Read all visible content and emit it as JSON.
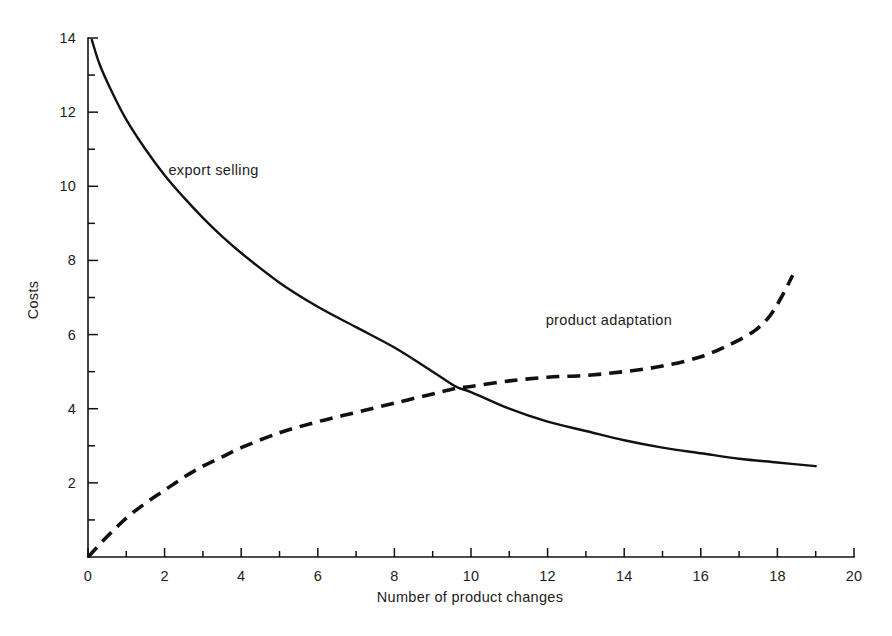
{
  "chart_data": {
    "type": "line",
    "title": "",
    "subtitle": "",
    "xlabel": "Number of product changes",
    "ylabel": "Costs",
    "xlim": [
      0,
      20
    ],
    "ylim": [
      0,
      14
    ],
    "grid": false,
    "legend_position": "inline-annotations",
    "x_ticks_major": [
      0,
      2,
      4,
      6,
      8,
      10,
      12,
      14,
      16,
      18,
      20
    ],
    "x_tick_labels": [
      "0",
      "2",
      "4",
      "6",
      "8",
      "10",
      "12",
      "14",
      "16",
      "18",
      "20"
    ],
    "x_ticks_minor": [
      1,
      3,
      5,
      7,
      9,
      11,
      13,
      15,
      17,
      19
    ],
    "y_ticks_major": [
      2,
      4,
      6,
      8,
      10,
      12,
      14
    ],
    "y_tick_labels": [
      "2",
      "4",
      "6",
      "8",
      "10",
      "12",
      "14"
    ],
    "y_ticks_minor": [
      1,
      3,
      5,
      7,
      9,
      11,
      13
    ],
    "series": [
      {
        "name": "export selling",
        "style": "solid",
        "label_text": "export selling",
        "label_x": 2.1,
        "label_y": 10.3,
        "x": [
          0.1,
          0.3,
          0.6,
          1.0,
          1.5,
          2.0,
          2.5,
          3.0,
          3.5,
          4.0,
          5.0,
          6.0,
          7.0,
          8.0,
          9.0,
          9.6,
          10.0,
          11.0,
          12.0,
          13.0,
          14.0,
          15.0,
          16.0,
          17.0,
          18.0,
          19.0
        ],
        "y": [
          13.95,
          13.3,
          12.6,
          11.8,
          11.0,
          10.3,
          9.7,
          9.15,
          8.65,
          8.2,
          7.4,
          6.75,
          6.2,
          5.65,
          5.0,
          4.6,
          4.45,
          4.0,
          3.65,
          3.4,
          3.15,
          2.95,
          2.8,
          2.65,
          2.55,
          2.45
        ]
      },
      {
        "name": "product adaptation",
        "style": "dashed",
        "label_text": "product adaptation",
        "label_x": 13.6,
        "label_y": 6.25,
        "x": [
          0.0,
          0.5,
          1.0,
          1.5,
          2.0,
          2.5,
          3.0,
          3.5,
          4.0,
          5.0,
          6.0,
          7.0,
          8.0,
          9.0,
          9.6,
          10.0,
          11.0,
          12.0,
          13.0,
          14.0,
          15.0,
          16.0,
          16.8,
          17.4,
          17.8,
          18.1,
          18.4
        ],
        "y": [
          0.0,
          0.55,
          1.05,
          1.45,
          1.8,
          2.15,
          2.45,
          2.7,
          2.95,
          3.35,
          3.65,
          3.9,
          4.15,
          4.4,
          4.55,
          4.6,
          4.75,
          4.85,
          4.9,
          5.0,
          5.15,
          5.4,
          5.75,
          6.1,
          6.5,
          7.0,
          7.6
        ]
      }
    ],
    "intersection": {
      "x": 9.6,
      "y": 4.55
    }
  },
  "labels": {
    "y_axis_title": "Costs",
    "x_axis_title": "Number of product changes",
    "series_one": "export selling",
    "series_two": "product adaptation"
  },
  "colors": {
    "background": "#ffffff",
    "ink": "#111111",
    "text": "#1c1c1c"
  }
}
